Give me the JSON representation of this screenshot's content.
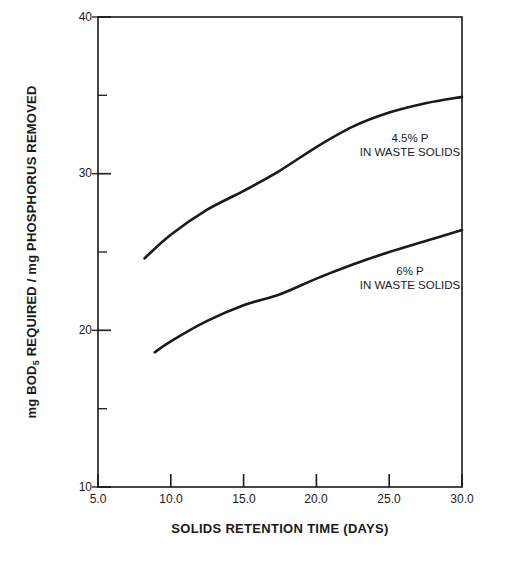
{
  "chart_data": {
    "type": "line",
    "title": "",
    "xlabel": "SOLIDS RETENTION TIME (DAYS)",
    "ylabel": "mg BOD5 REQUIRED / mg PHOSPHORUS REMOVED",
    "ylabel_parts": {
      "before_sub": "mg BOD",
      "sub": "5",
      "after_sub": " REQUIRED / mg PHOSPHORUS REMOVED"
    },
    "xlim": [
      5.0,
      30.0
    ],
    "ylim": [
      10,
      40
    ],
    "grid": false,
    "legend_position": "inline-annotations",
    "x_major_ticks": [
      "5.0",
      "10.0",
      "15.0",
      "20.0",
      "25.0",
      "30.0"
    ],
    "x_major_tick_values": [
      5.0,
      10.0,
      15.0,
      20.0,
      25.0,
      30.0
    ],
    "y_major_ticks": [
      "10",
      "20",
      "30",
      "40"
    ],
    "y_major_tick_values": [
      10,
      20,
      30,
      40
    ],
    "y_minor_tick_values": [
      15,
      25,
      35
    ],
    "series": [
      {
        "name": "4.5% P IN WASTE SOLIDS",
        "label_line1": "4.5% P",
        "label_line2": "IN WASTE SOLIDS",
        "color": "#1a1a1a",
        "x": [
          8.2,
          10.0,
          12.5,
          15.0,
          17.5,
          20.0,
          22.5,
          25.0,
          27.5,
          30.0
        ],
        "values": [
          24.6,
          26.1,
          27.7,
          28.9,
          30.2,
          31.7,
          33.0,
          33.9,
          34.5,
          34.9
        ]
      },
      {
        "name": "6% P IN WASTE SOLIDS",
        "label_line1": "6% P",
        "label_line2": "IN WASTE SOLIDS",
        "color": "#1a1a1a",
        "x": [
          8.9,
          10.0,
          12.5,
          15.0,
          17.5,
          20.0,
          22.5,
          25.0,
          27.5,
          30.0
        ],
        "values": [
          18.6,
          19.3,
          20.6,
          21.6,
          22.3,
          23.3,
          24.2,
          25.0,
          25.7,
          26.4
        ]
      }
    ]
  },
  "axes": {
    "frame_color": "#1a1a1a"
  }
}
